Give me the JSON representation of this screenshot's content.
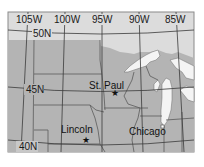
{
  "map": {
    "longitude_labels": [
      {
        "label": "105W",
        "x": 32,
        "y": 22
      },
      {
        "label": "100W",
        "x": 68,
        "y": 22
      },
      {
        "label": "95W",
        "x": 104,
        "y": 22
      },
      {
        "label": "90W",
        "x": 140,
        "y": 22
      },
      {
        "label": "85W",
        "x": 177,
        "y": 22
      }
    ],
    "latitude_labels": [
      {
        "label": "50N",
        "x": 41,
        "y": 37
      },
      {
        "label": "45N",
        "x": 33,
        "y": 93
      },
      {
        "label": "40N",
        "x": 26,
        "y": 150
      }
    ],
    "cities": [
      {
        "name": "St. Paul",
        "marker": "star",
        "label_x": 106,
        "label_y": 85,
        "mx": 115,
        "my": 92
      },
      {
        "name": "Lincoln",
        "marker": "star",
        "label_x": 80,
        "label_y": 134,
        "mx": 86,
        "my": 139
      },
      {
        "name": "Chicago",
        "marker": "square",
        "label_x": 150,
        "label_y": 135,
        "mx": 162,
        "my": 127
      }
    ],
    "colors": {
      "land": "#b4b4b4",
      "canada": "#dcdcdc",
      "water": "#f4f4f4",
      "border": "#5a5a5a",
      "graticule": "#3a3a3a",
      "frame": "#8a8a8a"
    }
  }
}
